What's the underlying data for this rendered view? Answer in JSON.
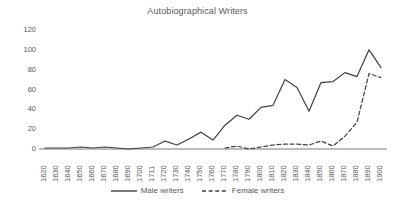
{
  "chart_data": {
    "type": "line",
    "title": "Autobiographical Writers",
    "xlabel": "",
    "ylabel": "",
    "ylim": [
      0,
      120
    ],
    "yticks": [
      0,
      20,
      40,
      60,
      80,
      100,
      120
    ],
    "grid": false,
    "legend_position": "bottom",
    "categories": [
      "1620",
      "1630",
      "1640",
      "1650",
      "1660",
      "1670",
      "1680",
      "1690",
      "1700",
      "1711",
      "1720",
      "1730",
      "1740",
      "1750",
      "1760",
      "1770",
      "1780",
      "1790",
      "1800",
      "1810",
      "1820",
      "1830",
      "1840",
      "1850",
      "1860",
      "1870",
      "1880",
      "1890",
      "1900"
    ],
    "series": [
      {
        "name": "Male writers",
        "style": "solid",
        "color": "#404040",
        "values": [
          1,
          1,
          1,
          2,
          1,
          2,
          1,
          0,
          1,
          2,
          8,
          4,
          10,
          17,
          9,
          24,
          34,
          30,
          42,
          44,
          70,
          62,
          38,
          67,
          68,
          77,
          73,
          100,
          82
        ]
      },
      {
        "name": "Female writers",
        "style": "dashed",
        "color": "#404040",
        "values": [
          null,
          null,
          null,
          null,
          null,
          null,
          null,
          null,
          null,
          null,
          null,
          null,
          null,
          null,
          null,
          1,
          3,
          0,
          2,
          4,
          5,
          5,
          4,
          8,
          3,
          13,
          27,
          76,
          72
        ]
      }
    ]
  },
  "legend": {
    "entries": [
      {
        "label": "Male writers",
        "icon": "solid-line-icon"
      },
      {
        "label": "Female writers",
        "icon": "dashed-line-icon"
      }
    ]
  },
  "colors": {
    "line": "#404040",
    "axis": "#a6a6a6",
    "text": "#595959",
    "background": "#ffffff"
  }
}
